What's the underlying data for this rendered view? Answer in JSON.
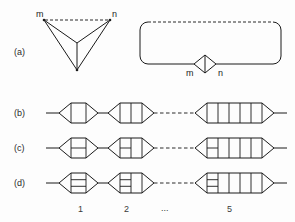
{
  "figure": {
    "width": 295,
    "height": 222,
    "background": "#fdfdfd",
    "ink": "#1a1a1a"
  },
  "row_labels": [
    {
      "id": "a",
      "text": "(a)",
      "x": 14,
      "y": 55
    },
    {
      "id": "b",
      "text": "(b)",
      "x": 14,
      "y": 116
    },
    {
      "id": "c",
      "text": "(c)",
      "x": 14,
      "y": 151
    },
    {
      "id": "d",
      "text": "(d)",
      "x": 14,
      "y": 186
    }
  ],
  "row_a": {
    "left_graph": {
      "name": "tetrahedron-projection",
      "vertex_labels": [
        {
          "text": "m",
          "x": 36,
          "y": 17
        },
        {
          "text": "n",
          "x": 112,
          "y": 17
        }
      ],
      "dashed_edge": {
        "from": "m",
        "to": "n"
      },
      "description": "triangle with interior vertex joined to all three corners"
    },
    "right_graph": {
      "name": "loop-with-diamond",
      "vertex_labels": [
        {
          "text": "m",
          "x": 186,
          "y": 76
        },
        {
          "text": "n",
          "x": 218,
          "y": 76
        }
      ],
      "dashed_edge": {
        "position": "top"
      },
      "description": "rounded rectangle loop with small diamond bigon at bottom centre"
    }
  },
  "chains": [
    {
      "id": "b",
      "cells": [
        {
          "index": 1,
          "verticals": 2,
          "rungs": 0
        },
        {
          "index": 2,
          "verticals": 3,
          "rungs": 0
        },
        {
          "index": 5,
          "verticals": 6,
          "rungs": 0
        }
      ]
    },
    {
      "id": "c",
      "cells": [
        {
          "index": 1,
          "verticals": 2,
          "rungs": 1
        },
        {
          "index": 2,
          "verticals": 3,
          "rungs": 1
        },
        {
          "index": 5,
          "verticals": 6,
          "rungs": 1
        }
      ]
    },
    {
      "id": "d",
      "cells": [
        {
          "index": 1,
          "verticals": 2,
          "rungs": 2
        },
        {
          "index": 2,
          "verticals": 3,
          "rungs": 2
        },
        {
          "index": 5,
          "verticals": 6,
          "rungs": 2
        }
      ]
    }
  ],
  "index_labels": [
    {
      "text": "1",
      "x": 78,
      "y": 212
    },
    {
      "text": "2",
      "x": 124,
      "y": 212
    },
    {
      "text": "...",
      "x": 167,
      "y": 211
    },
    {
      "text": "5",
      "x": 227,
      "y": 212
    }
  ]
}
